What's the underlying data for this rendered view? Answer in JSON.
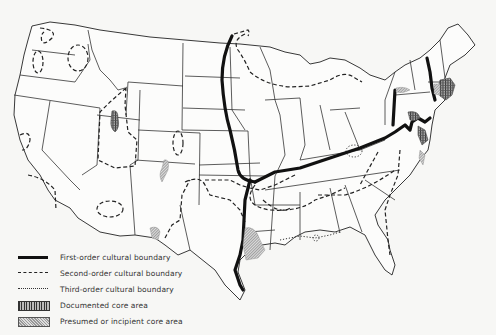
{
  "figure": {
    "type": "map",
    "colors": {
      "background": "#f7f7f5",
      "boundary_line": "#111111",
      "documented_core_fill": "#555555",
      "presumed_core_fill": "#aaaaaa"
    }
  },
  "legend": {
    "items": [
      {
        "symbol": "first-order-line",
        "label": "First-order cultural boundary"
      },
      {
        "symbol": "second-order-line",
        "label": "Second-order cultural boundary"
      },
      {
        "symbol": "third-order-line",
        "label": "Third-order cultural boundary"
      },
      {
        "symbol": "documented-core-pattern",
        "label": "Documented core area"
      },
      {
        "symbol": "presumed-core-pattern",
        "label": "Presumed or incipient core area"
      }
    ]
  }
}
